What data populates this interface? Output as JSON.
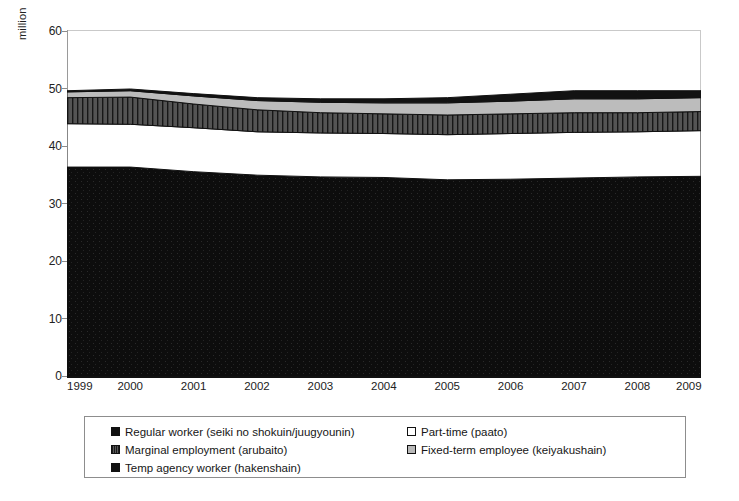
{
  "chart_data": {
    "type": "area",
    "stacked": true,
    "title": "",
    "subtitle": "",
    "xlabel": "",
    "ylabel": "million",
    "x": [
      1999,
      2000,
      2001,
      2002,
      2003,
      2004,
      2005,
      2006,
      2007,
      2008,
      2009
    ],
    "tick_labels": [
      "1999",
      "2000",
      "2001",
      "2002",
      "2003",
      "2004",
      "2005",
      "2006",
      "2007",
      "2008",
      "2009"
    ],
    "ylim": [
      0,
      60
    ],
    "yticks": [
      0,
      10,
      20,
      30,
      40,
      50,
      60
    ],
    "grid": false,
    "legend_position": "bottom",
    "series": [
      {
        "name": "Regular worker (seiki no shokuin/juugyounin)",
        "color": "#111111",
        "pattern": "solid",
        "values": [
          36.3,
          36.3,
          35.5,
          34.9,
          34.6,
          34.5,
          34.1,
          34.2,
          34.4,
          34.6,
          34.7
        ]
      },
      {
        "name": "Part-time (paato)",
        "color": "#ffffff",
        "pattern": "none",
        "values": [
          7.5,
          7.4,
          7.6,
          7.5,
          7.6,
          7.6,
          7.8,
          7.9,
          7.9,
          7.8,
          7.9
        ]
      },
      {
        "name": "Marginal employment (arubaito)",
        "color": "#4a4a4a",
        "pattern": "vertical-hatch",
        "values": [
          4.5,
          4.7,
          4.1,
          3.8,
          3.5,
          3.4,
          3.4,
          3.4,
          3.4,
          3.3,
          3.3
        ]
      },
      {
        "name": "Fixed-term employee (keiyakushain)",
        "color": "#b9b9b9",
        "pattern": "solid",
        "values": [
          1.0,
          1.1,
          1.4,
          1.6,
          1.8,
          1.9,
          2.1,
          2.2,
          2.4,
          2.4,
          2.4
        ]
      },
      {
        "name": "Temp agency worker (hakenshain)",
        "color": "#111111",
        "pattern": "solid",
        "values": [
          0.2,
          0.3,
          0.4,
          0.5,
          0.6,
          0.7,
          0.9,
          1.2,
          1.4,
          1.4,
          1.2
        ]
      }
    ],
    "totals": [
      49.5,
      49.8,
      49.0,
      48.3,
      48.1,
      48.1,
      48.3,
      48.9,
      49.5,
      49.5,
      49.5
    ]
  },
  "legend": {
    "columns": [
      {
        "items": [
          {
            "label": "Regular worker (seiki no shokuin/juugyounin)",
            "swatch": "solid-black"
          },
          {
            "label": "Marginal employment (arubaito)",
            "swatch": "hatch"
          },
          {
            "label": "Temp agency worker (hakenshain)",
            "swatch": "solid-black"
          }
        ]
      },
      {
        "items": [
          {
            "label": "Part-time (paato)",
            "swatch": "white"
          },
          {
            "label": "Fixed-term employee (keiyakushain)",
            "swatch": "grey"
          }
        ]
      }
    ]
  },
  "axis": {
    "y_title": "million",
    "y_ticks": [
      "60",
      "50",
      "40",
      "30",
      "20",
      "10",
      "0"
    ],
    "x_ticks": [
      "1999",
      "2000",
      "2001",
      "2002",
      "2003",
      "2004",
      "2005",
      "2006",
      "2007",
      "2008",
      "2009"
    ]
  },
  "colors": {
    "regular_worker": "#111111",
    "part_time": "#ffffff",
    "marginal_employment": "#4a4a4a",
    "fixed_term": "#b9b9b9",
    "temp_agency": "#111111",
    "axis": "#8b8b8b",
    "frame": "#c9c9c9"
  }
}
